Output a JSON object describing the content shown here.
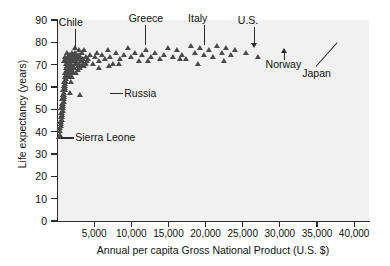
{
  "chart_data": {
    "type": "scatter",
    "title": "",
    "xlabel": "Annual per capita Gross National Product (U.S. $)",
    "ylabel": "Life expectancy (years)",
    "xlim": [
      0,
      42000
    ],
    "ylim": [
      0,
      90
    ],
    "grid": false,
    "legend": null,
    "marker": "triangle",
    "marker_color": "#4a4a4a",
    "plot_background": "#f1f1f1",
    "xticks": [
      5000,
      10000,
      15000,
      20000,
      25000,
      30000,
      35000,
      40000
    ],
    "xtick_labels": [
      "5,000",
      "10,000",
      "15,000",
      "20,000",
      "25,000",
      "30,000",
      "35,000",
      "40,000"
    ],
    "yticks": [
      0,
      10,
      20,
      30,
      40,
      50,
      60,
      70,
      80,
      90
    ],
    "ytick_labels": [
      "0",
      "10",
      "20",
      "30",
      "40",
      "50",
      "60",
      "70",
      "80",
      "90"
    ],
    "points": [
      [
        300,
        37
      ],
      [
        350,
        41
      ],
      [
        420,
        44
      ],
      [
        480,
        46
      ],
      [
        520,
        43
      ],
      [
        560,
        48
      ],
      [
        600,
        50
      ],
      [
        640,
        45
      ],
      [
        680,
        52
      ],
      [
        700,
        47
      ],
      [
        740,
        54
      ],
      [
        780,
        49
      ],
      [
        800,
        56
      ],
      [
        830,
        51
      ],
      [
        860,
        58
      ],
      [
        890,
        53
      ],
      [
        910,
        60
      ],
      [
        940,
        55
      ],
      [
        970,
        62
      ],
      [
        1000,
        57
      ],
      [
        1030,
        64
      ],
      [
        1060,
        59
      ],
      [
        1090,
        66
      ],
      [
        1120,
        61
      ],
      [
        1150,
        68
      ],
      [
        1180,
        63
      ],
      [
        1210,
        70
      ],
      [
        1240,
        65
      ],
      [
        1270,
        72
      ],
      [
        1300,
        67
      ],
      [
        1340,
        69
      ],
      [
        1380,
        71
      ],
      [
        1420,
        66
      ],
      [
        1460,
        73
      ],
      [
        1500,
        68
      ],
      [
        1540,
        70
      ],
      [
        1580,
        64
      ],
      [
        1620,
        72
      ],
      [
        1660,
        67
      ],
      [
        1700,
        74
      ],
      [
        1740,
        69
      ],
      [
        1780,
        71
      ],
      [
        1820,
        66
      ],
      [
        1860,
        73
      ],
      [
        1900,
        68
      ],
      [
        1950,
        70
      ],
      [
        2000,
        75
      ],
      [
        2050,
        67
      ],
      [
        2100,
        72
      ],
      [
        2150,
        69
      ],
      [
        2200,
        71
      ],
      [
        2260,
        74
      ],
      [
        2320,
        68
      ],
      [
        2380,
        73
      ],
      [
        2440,
        70
      ],
      [
        2500,
        72
      ],
      [
        2560,
        66
      ],
      [
        2620,
        71
      ],
      [
        2700,
        74
      ],
      [
        2780,
        69
      ],
      [
        2860,
        72
      ],
      [
        2950,
        70
      ],
      [
        3050,
        73
      ],
      [
        3150,
        68
      ],
      [
        3250,
        71
      ],
      [
        3350,
        75
      ],
      [
        3450,
        70
      ],
      [
        3550,
        72
      ],
      [
        3700,
        69
      ],
      [
        3850,
        73
      ],
      [
        4000,
        71
      ],
      [
        380,
        38
      ],
      [
        440,
        40
      ],
      [
        500,
        42
      ],
      [
        580,
        44
      ],
      [
        660,
        46
      ],
      [
        720,
        48
      ],
      [
        790,
        50
      ],
      [
        850,
        52
      ],
      [
        920,
        54
      ],
      [
        990,
        56
      ],
      [
        1070,
        58
      ],
      [
        1140,
        60
      ],
      [
        1220,
        62
      ],
      [
        1290,
        64
      ],
      [
        1360,
        66
      ],
      [
        1440,
        68
      ],
      [
        1520,
        70
      ],
      [
        1600,
        65
      ],
      [
        1690,
        67
      ],
      [
        1770,
        69
      ],
      [
        1850,
        62
      ],
      [
        1930,
        71
      ],
      [
        2020,
        64
      ],
      [
        2110,
        73
      ],
      [
        2200,
        66
      ],
      [
        2300,
        68
      ],
      [
        2420,
        75
      ],
      [
        2550,
        70
      ],
      [
        2680,
        72
      ],
      [
        2820,
        67
      ],
      [
        3000,
        74
      ],
      [
        3200,
        69
      ],
      [
        3400,
        71
      ],
      [
        3600,
        76
      ],
      [
        3900,
        70
      ],
      [
        900,
        71
      ],
      [
        1100,
        73
      ],
      [
        1350,
        75
      ],
      [
        1600,
        74
      ],
      [
        2400,
        77
      ],
      [
        2900,
        76
      ],
      [
        4200,
        72
      ],
      [
        4500,
        74
      ],
      [
        4800,
        70
      ],
      [
        5100,
        73
      ],
      [
        5400,
        75
      ],
      [
        5700,
        71
      ],
      [
        6000,
        74
      ],
      [
        6400,
        72
      ],
      [
        6800,
        76
      ],
      [
        7200,
        73
      ],
      [
        7600,
        70
      ],
      [
        8000,
        75
      ],
      [
        8500,
        72
      ],
      [
        9000,
        74
      ],
      [
        9500,
        77
      ],
      [
        10000,
        73
      ],
      [
        10500,
        75
      ],
      [
        11000,
        71
      ],
      [
        11500,
        74
      ],
      [
        12000,
        76
      ],
      [
        12600,
        73
      ],
      [
        13200,
        75
      ],
      [
        13800,
        72
      ],
      [
        14400,
        74
      ],
      [
        15000,
        77
      ],
      [
        15600,
        73
      ],
      [
        16200,
        76
      ],
      [
        16800,
        74
      ],
      [
        17400,
        72
      ],
      [
        18000,
        78
      ],
      [
        18600,
        75
      ],
      [
        19200,
        77
      ],
      [
        19800,
        74
      ],
      [
        20400,
        76
      ],
      [
        21000,
        73
      ],
      [
        21600,
        78
      ],
      [
        22200,
        75
      ],
      [
        22800,
        77
      ],
      [
        23400,
        74
      ],
      [
        24000,
        76
      ],
      [
        25500,
        75
      ],
      [
        27000,
        73
      ],
      [
        1800,
        57
      ],
      [
        3100,
        56
      ],
      [
        5600,
        68
      ],
      [
        7000,
        69
      ],
      [
        8300,
        70
      ],
      [
        12300,
        71
      ],
      [
        16500,
        72
      ],
      [
        19000,
        70
      ],
      [
        22500,
        71
      ]
    ],
    "annotations": [
      {
        "label": "Chile",
        "point_gnp": 2400,
        "point_le": 76,
        "style": "leader-down"
      },
      {
        "label": "Greece",
        "point_gnp": 11800,
        "point_le": 78,
        "style": "leader-down"
      },
      {
        "label": "Italy",
        "point_gnp": 19800,
        "point_le": 78,
        "style": "leader-down"
      },
      {
        "label": "U.S.",
        "point_gnp": 26500,
        "point_le": 77,
        "style": "arrow-down"
      },
      {
        "label": "Russia",
        "point_gnp": 6900,
        "point_le": 57,
        "style": "leader-left"
      },
      {
        "label": "Sierra Leone",
        "point_gnp": 300,
        "point_le": 37,
        "style": "leader-left"
      },
      {
        "label": "Norway",
        "point_gnp": 30500,
        "point_le": 78,
        "style": "arrow-up"
      },
      {
        "label": "Japan",
        "point_gnp": 38000,
        "point_le": 81,
        "style": "leader-diagonal"
      }
    ]
  }
}
